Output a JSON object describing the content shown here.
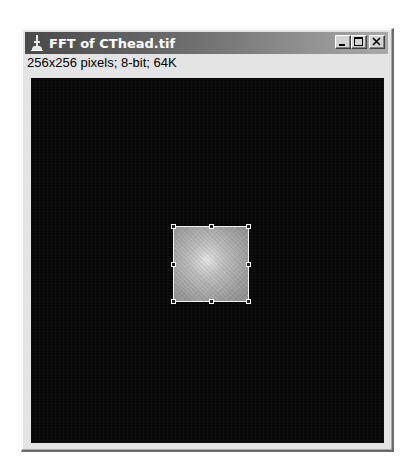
{
  "window": {
    "title": "FFT of CThead.tif",
    "icon": "imagej-microscope-icon",
    "buttons": {
      "minimize": "minimize-icon",
      "maximize": "maximize-icon",
      "close": "close-icon"
    }
  },
  "image_info": {
    "text": "256x256 pixels; 8-bit; 64K",
    "width_px": 256,
    "height_px": 256,
    "bit_depth": "8-bit",
    "size": "64K"
  },
  "canvas": {
    "background": "#080808",
    "roi": {
      "shape": "rectangle",
      "handles": 8,
      "fill_center": "#e2e2e2",
      "fill_edge": "#8a8a8a",
      "border": "#f0f0f0"
    }
  },
  "colors": {
    "titlebar_start": "#4a4a4a",
    "titlebar_end": "#a9a9a9",
    "window_bg": "#e4e4e4"
  }
}
